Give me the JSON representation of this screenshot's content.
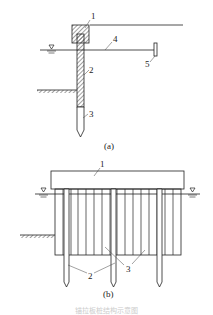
{
  "figure_a": {
    "caption": "(a)",
    "labels": {
      "cap": "1",
      "sheet_pile": "2",
      "pile_tip": "3",
      "tie_rod": "4",
      "anchor": "5"
    }
  },
  "figure_b": {
    "caption": "(b)",
    "labels": {
      "cap": "1",
      "piles": "2",
      "sheet_piles": "3"
    }
  },
  "figure_caption": "锚拉板桩结构示意图"
}
